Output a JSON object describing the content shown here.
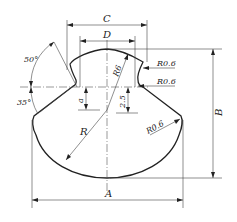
{
  "figure": {
    "type": "engineering-drawing"
  },
  "dimensions": {
    "A": "A",
    "B": "B",
    "C": "C",
    "D": "D",
    "R": "R",
    "a": "a",
    "r_top": "R6",
    "r_notch1": "R0.6",
    "r_notch2": "R0.6",
    "r_side": "R0.6",
    "offset": "2.5",
    "angle_upper": "50°",
    "angle_lower": "35°"
  }
}
